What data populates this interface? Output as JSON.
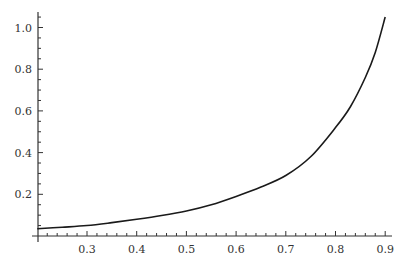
{
  "chart_data": {
    "type": "line",
    "title": "",
    "xlabel": "",
    "ylabel": "",
    "xlim": [
      0.2,
      0.9
    ],
    "ylim": [
      0.0,
      1.08
    ],
    "grid": false,
    "legend": null,
    "x_ticks": [
      0.3,
      0.4,
      0.5,
      0.6,
      0.7,
      0.8,
      0.9
    ],
    "x_tick_labels": [
      "0.3",
      "0.4",
      "0.5",
      "0.6",
      "0.7",
      "0.8",
      "0.9"
    ],
    "y_ticks": [
      0.2,
      0.4,
      0.6,
      0.8,
      1.0
    ],
    "y_tick_labels": [
      "0.2",
      "0.4",
      "0.6",
      "0.8",
      "1.0"
    ],
    "series": [
      {
        "name": "curve",
        "color": "#1a1a1a",
        "x": [
          0.2,
          0.25,
          0.3,
          0.35,
          0.4,
          0.45,
          0.5,
          0.55,
          0.6,
          0.65,
          0.7,
          0.75,
          0.8,
          0.83,
          0.86,
          0.88,
          0.9
        ],
        "y": [
          0.035,
          0.042,
          0.05,
          0.064,
          0.08,
          0.098,
          0.12,
          0.15,
          0.19,
          0.235,
          0.29,
          0.38,
          0.52,
          0.62,
          0.76,
          0.88,
          1.05
        ]
      }
    ]
  }
}
